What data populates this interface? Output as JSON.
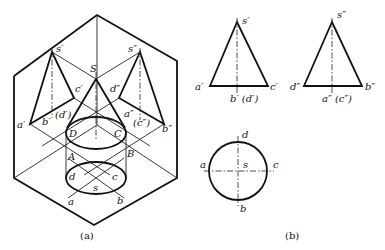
{
  "figure_a": {
    "caption": "(a)",
    "labels": {
      "S": "S",
      "s_prime": "s′",
      "s_dprime": "s″",
      "a_prime": "a′",
      "b_prime": "b′",
      "c_prime": "c′",
      "d_prime_paren": "(d′)",
      "a_dprime": "a″",
      "b_dprime": "b″",
      "c_dprime_paren": "(c″)",
      "d_dprime": "d″",
      "A": "A",
      "B": "B",
      "C": "C",
      "D": "D",
      "a": "a",
      "b": "b",
      "c": "c",
      "d": "d",
      "s": "s"
    }
  },
  "figure_b": {
    "caption": "(b)",
    "front_view": {
      "apex": "s′",
      "left": "a′",
      "right": "c′",
      "bottom": "b′ (d′)"
    },
    "side_view": {
      "apex": "s″",
      "left": "d″",
      "right": "b″",
      "bottom": "a″ (c″)"
    },
    "top_view": {
      "top": "d",
      "bottom": "b",
      "left": "a",
      "right": "c",
      "center": "s"
    }
  }
}
